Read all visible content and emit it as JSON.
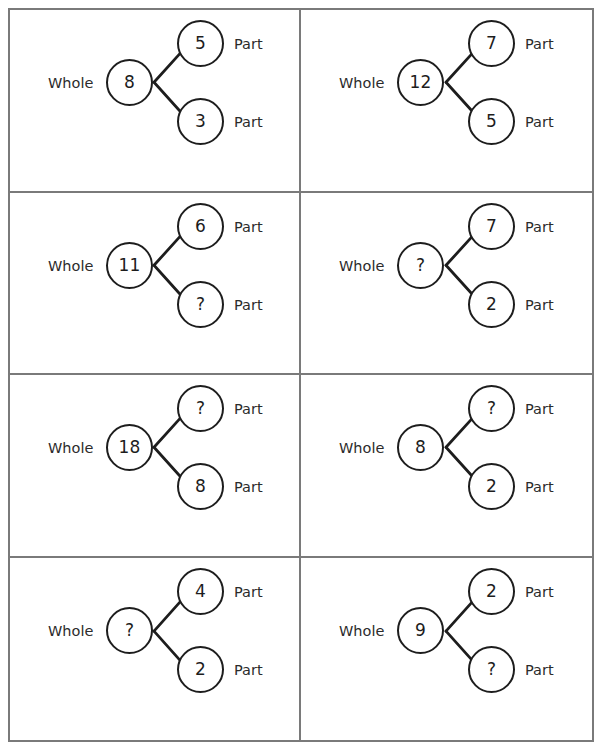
{
  "worksheet": {
    "title": "Part-Whole Number Bonds",
    "labels": {
      "whole": "Whole",
      "part": "Part",
      "unknown": "?"
    },
    "colors": {
      "page_background": "#ffffff",
      "grid_border": "#7a7a7a",
      "node_stroke": "#1d1d1d",
      "connector_stroke": "#1d1d1d",
      "text": "#2b2b2b"
    },
    "layout": {
      "columns": 2,
      "rows": 4,
      "total_cells": 8
    },
    "cells": [
      {
        "index": 1,
        "whole_label": "Whole",
        "whole_value": "8",
        "part1_label": "Part",
        "part1_value": "5",
        "part2_label": "Part",
        "part2_value": "3",
        "unknown_position": "none"
      },
      {
        "index": 2,
        "whole_label": "Whole",
        "whole_value": "12",
        "part1_label": "Part",
        "part1_value": "7",
        "part2_label": "Part",
        "part2_value": "5",
        "unknown_position": "none"
      },
      {
        "index": 3,
        "whole_label": "Whole",
        "whole_value": "11",
        "part1_label": "Part",
        "part1_value": "6",
        "part2_label": "Part",
        "part2_value": "?",
        "unknown_position": "part2"
      },
      {
        "index": 4,
        "whole_label": "Whole",
        "whole_value": "?",
        "part1_label": "Part",
        "part1_value": "7",
        "part2_label": "Part",
        "part2_value": "2",
        "unknown_position": "whole"
      },
      {
        "index": 5,
        "whole_label": "Whole",
        "whole_value": "18",
        "part1_label": "Part",
        "part1_value": "?",
        "part2_label": "Part",
        "part2_value": "8",
        "unknown_position": "part1"
      },
      {
        "index": 6,
        "whole_label": "Whole",
        "whole_value": "8",
        "part1_label": "Part",
        "part1_value": "?",
        "part2_label": "Part",
        "part2_value": "2",
        "unknown_position": "part1"
      },
      {
        "index": 7,
        "whole_label": "Whole",
        "whole_value": "?",
        "part1_label": "Part",
        "part1_value": "4",
        "part2_label": "Part",
        "part2_value": "2",
        "unknown_position": "whole"
      },
      {
        "index": 8,
        "whole_label": "Whole",
        "whole_value": "9",
        "part1_label": "Part",
        "part1_value": "2",
        "part2_label": "Part",
        "part2_value": "?",
        "unknown_position": "part2"
      }
    ]
  }
}
